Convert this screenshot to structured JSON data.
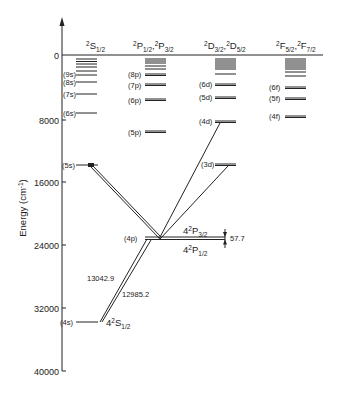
{
  "diagram": {
    "type": "energy-level diagram (Grotrian)",
    "y_axis": {
      "label": "Energy (cm",
      "label_sup": "-1",
      "label_close": ")",
      "ticks": [
        "0",
        "8000",
        "16000",
        "24000",
        "32000",
        "40000"
      ]
    },
    "columns": {
      "s": {
        "pre": "2",
        "main": "S",
        "sub": "1/2"
      },
      "p": {
        "pre1": "2",
        "main1": "P",
        "sub1": "1/2",
        "sep": ",",
        "pre2": "2",
        "main2": "P",
        "sub2": "3/2"
      },
      "d": {
        "pre1": "2",
        "main1": "D",
        "sub1": "3/2",
        "sep": ",",
        "pre2": "2",
        "main2": "D",
        "sub2": "5/2"
      },
      "f": {
        "pre1": "2",
        "main1": "F",
        "sub1": "5/2",
        "sep": ",",
        "pre2": "2",
        "main2": "F",
        "sub2": "7/2"
      }
    },
    "levels": {
      "s": [
        "(9s)",
        "(8s)",
        "(7s)",
        "(6s)",
        "(5s)",
        "(4s)"
      ],
      "p": [
        "(8p)",
        "(7p)",
        "(6p)",
        "(5p)",
        "(4p)"
      ],
      "d": [
        "(6d)",
        "(5d)",
        "(4d)",
        "(3d)"
      ],
      "f": [
        "(6f)",
        "(5f)",
        "(4f)"
      ]
    },
    "annotations": {
      "ground_state": {
        "n": "4",
        "pre": "2",
        "main": "S",
        "sub": "1/2"
      },
      "p32": {
        "n": "4",
        "pre": "2",
        "main": "P",
        "sub": "3/2"
      },
      "p12": {
        "n": "4",
        "pre": "2",
        "main": "P",
        "sub": "1/2"
      },
      "fine_splitting": "57.7",
      "transition_1": "13042.9",
      "transition_2": "12985.2"
    }
  }
}
